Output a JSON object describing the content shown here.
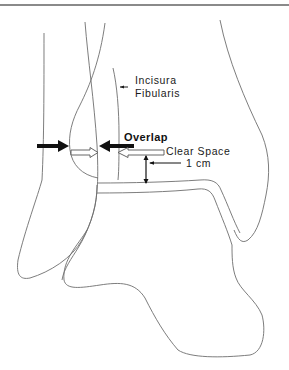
{
  "figure": {
    "type": "anatomical line drawing",
    "labels": {
      "incisura_line1": "Incisura",
      "incisura_line2": "Fibularis",
      "overlap": "Overlap",
      "clear_space": "Clear Space",
      "one_cm": "1 cm"
    },
    "colors": {
      "outline": "#6e6e6e",
      "arrow_solid": "#111111",
      "arrow_hollow_stroke": "#555555",
      "text": "#1a1a1a",
      "top_rule": "#8a8a8a"
    }
  }
}
